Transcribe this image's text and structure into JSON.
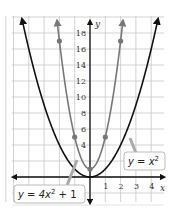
{
  "chart_data": {
    "type": "line",
    "title": "",
    "xlabel": "x",
    "ylabel": "y",
    "xlim": [
      -5.5,
      4.5
    ],
    "ylim": [
      -2,
      21
    ],
    "grid": true,
    "x_ticks": [
      1,
      2,
      3,
      4
    ],
    "y_ticks": [
      4,
      6,
      8,
      10,
      12,
      14,
      16,
      18
    ],
    "series": [
      {
        "name": "y = x^2",
        "label": "y = x²",
        "color": "#111111",
        "expression": "x^2",
        "points": []
      },
      {
        "name": "y = 4x^2 + 1",
        "label": "y = 4x² + 1",
        "color": "#777777",
        "expression": "4x^2+1",
        "points": [
          [
            -2,
            17
          ],
          [
            -1,
            5
          ],
          [
            0,
            1
          ],
          [
            1,
            5
          ],
          [
            2,
            17
          ]
        ]
      }
    ],
    "annotations": [
      {
        "text": "y = x²",
        "target_series": "y = x^2"
      },
      {
        "text": "y = 4x² + 1",
        "target_series": "y = 4x^2 + 1"
      }
    ]
  },
  "labels": {
    "x_axis": "x",
    "y_axis": "y",
    "series1_label_pre": "y = x",
    "series1_label_sup": "2",
    "series2_label_pre": "y = 4x",
    "series2_label_sup": "2",
    "series2_label_post": " + 1"
  }
}
